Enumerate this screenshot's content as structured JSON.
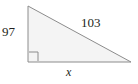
{
  "figure": {
    "name": "right-triangle-diagram",
    "type": "right triangle",
    "background_color": "#ffffff",
    "fill_color": "#f4f4f4",
    "stroke_color": "#8c8c8c",
    "text_color": "#231f20",
    "vertices": {
      "top_left": [
        28,
        6
      ],
      "bottom_left": [
        28,
        62
      ],
      "bottom_right": [
        131,
        62
      ]
    },
    "right_angle_marker": {
      "name": "right-angle-marker",
      "corner": "bottom-left",
      "size": 9
    },
    "labels": {
      "vertical_leg": "97",
      "hypotenuse": "103",
      "horizontal_leg": "x"
    }
  }
}
